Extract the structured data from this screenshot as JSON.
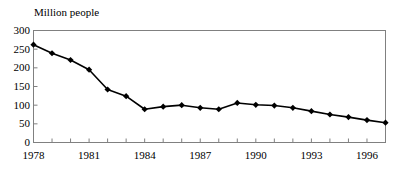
{
  "chart_data": {
    "type": "line",
    "title": "",
    "subtitle": "",
    "ylabel": "Million people",
    "xlabel": "",
    "ylim": [
      0,
      300
    ],
    "ytick_values": [
      0,
      50,
      100,
      150,
      200,
      250,
      300
    ],
    "ytick_labels": [
      "0",
      "50",
      "100",
      "150",
      "200",
      "250",
      "300"
    ],
    "xlim": [
      1978,
      1997
    ],
    "x": [
      1978,
      1979,
      1980,
      1981,
      1982,
      1983,
      1984,
      1985,
      1986,
      1987,
      1988,
      1989,
      1990,
      1991,
      1992,
      1993,
      1994,
      1995,
      1996,
      1997
    ],
    "xtick_values": [
      1978,
      1979,
      1980,
      1981,
      1982,
      1983,
      1984,
      1985,
      1986,
      1987,
      1988,
      1989,
      1990,
      1991,
      1992,
      1993,
      1994,
      1995,
      1996,
      1997
    ],
    "xtick_labels_shown": [
      "1978",
      "1981",
      "1984",
      "1987",
      "1990",
      "1993",
      "1996"
    ],
    "xtick_labels_shown_values": [
      1978,
      1981,
      1984,
      1987,
      1990,
      1993,
      1996
    ],
    "values": [
      262,
      239,
      221,
      195,
      142,
      124,
      89,
      96,
      100,
      93,
      89,
      106,
      101,
      99,
      93,
      84,
      75,
      68,
      60,
      53
    ],
    "grid": false,
    "legend": false,
    "legend_position": "none",
    "marker": "diamond",
    "line_color": "#000000",
    "marker_color": "#000000",
    "frame_color": "#808080",
    "background": "#ffffff"
  },
  "figure": {
    "units_note": "Million people"
  }
}
